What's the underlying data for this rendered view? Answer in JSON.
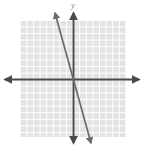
{
  "figure": {
    "width": 144,
    "height": 150,
    "background_color": "#ffffff"
  },
  "labels": {
    "y_axis": "y"
  },
  "colors": {
    "background": "#ffffff",
    "grid_fill": "#e3e3e3",
    "grid_line": "#ffffff",
    "axis": "#4a4a4a",
    "plotted_line": "#6b6b6b",
    "label_text": "#8d8d8d"
  },
  "chart_data": {
    "type": "line",
    "title": "",
    "subtitle": "",
    "xlabel": "",
    "ylabel": "y",
    "grid": true,
    "legend": false,
    "legend_position": "none",
    "origin_px": {
      "x": 73,
      "y": 79
    },
    "grid_cell_px": 6.6,
    "xlim": [
      -8,
      8
    ],
    "ylim": [
      -9,
      9
    ],
    "x_tick_labels": [],
    "y_tick_labels": [],
    "axes": {
      "x_axis": {
        "label": "x-axis",
        "from_px": {
          "x": 5,
          "y": 79
        },
        "to_px": {
          "x": 139,
          "y": 79
        },
        "arrowheads": "both"
      },
      "y_axis": {
        "label": "y-axis",
        "from_px": {
          "x": 73,
          "y": 13
        },
        "to_px": {
          "x": 73,
          "y": 143
        },
        "arrowheads": "both"
      }
    },
    "grid_rect_px": {
      "x": 20,
      "y": 21,
      "width": 106,
      "height": 116
    },
    "series": [
      {
        "name": "line-1",
        "kind": "linear",
        "slope": -3.6,
        "intercept": 0,
        "points_px": [
          {
            "x": 55,
            "y": 13
          },
          {
            "x": 91,
            "y": 143
          }
        ],
        "points_data": [
          {
            "x": -2.7,
            "y": 10.0
          },
          {
            "x": 2.7,
            "y": -9.7
          }
        ],
        "arrowheads": "both",
        "passes_through_origin": true
      }
    ],
    "annotations": []
  }
}
